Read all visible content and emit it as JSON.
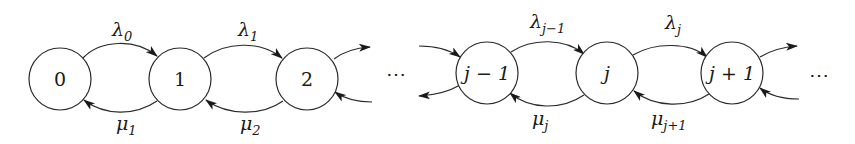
{
  "diagram": {
    "type": "birth-death-process-state-diagram",
    "background": "#ffffff",
    "stroke_color": "#2a2a2a",
    "nodes": [
      {
        "id": "s0",
        "label": "0",
        "cx": 60,
        "cy": 79,
        "r": 31
      },
      {
        "id": "s1",
        "label": "1",
        "cx": 180,
        "cy": 79,
        "r": 31
      },
      {
        "id": "s2",
        "label": "2",
        "cx": 307,
        "cy": 79,
        "r": 31
      },
      {
        "id": "sjm1",
        "label": "j − 1",
        "cx": 487,
        "cy": 73,
        "r": 31
      },
      {
        "id": "sj",
        "label": "j",
        "cx": 607,
        "cy": 73,
        "r": 31
      },
      {
        "id": "sjp1",
        "label": "j + 1",
        "cx": 732,
        "cy": 73,
        "r": 31
      }
    ],
    "edges": [
      {
        "from": "0",
        "to": "1",
        "direction": "forward",
        "label_base": "λ",
        "label_sub": "0"
      },
      {
        "from": "1",
        "to": "0",
        "direction": "backward",
        "label_base": "μ",
        "label_sub": "1"
      },
      {
        "from": "1",
        "to": "2",
        "direction": "forward",
        "label_base": "λ",
        "label_sub": "1"
      },
      {
        "from": "2",
        "to": "1",
        "direction": "backward",
        "label_base": "μ",
        "label_sub": "2"
      },
      {
        "from": "j − 1",
        "to": "j",
        "direction": "forward",
        "label_base": "λ",
        "label_sub": "j−1"
      },
      {
        "from": "j",
        "to": "j − 1",
        "direction": "backward",
        "label_base": "μ",
        "label_sub": "j"
      },
      {
        "from": "j",
        "to": "j + 1",
        "direction": "forward",
        "label_base": "λ",
        "label_sub": "j"
      },
      {
        "from": "j + 1",
        "to": "j",
        "direction": "backward",
        "label_base": "μ",
        "label_sub": "j+1"
      }
    ],
    "ellipsis_left": "⋯",
    "ellipsis_right": "⋯"
  }
}
